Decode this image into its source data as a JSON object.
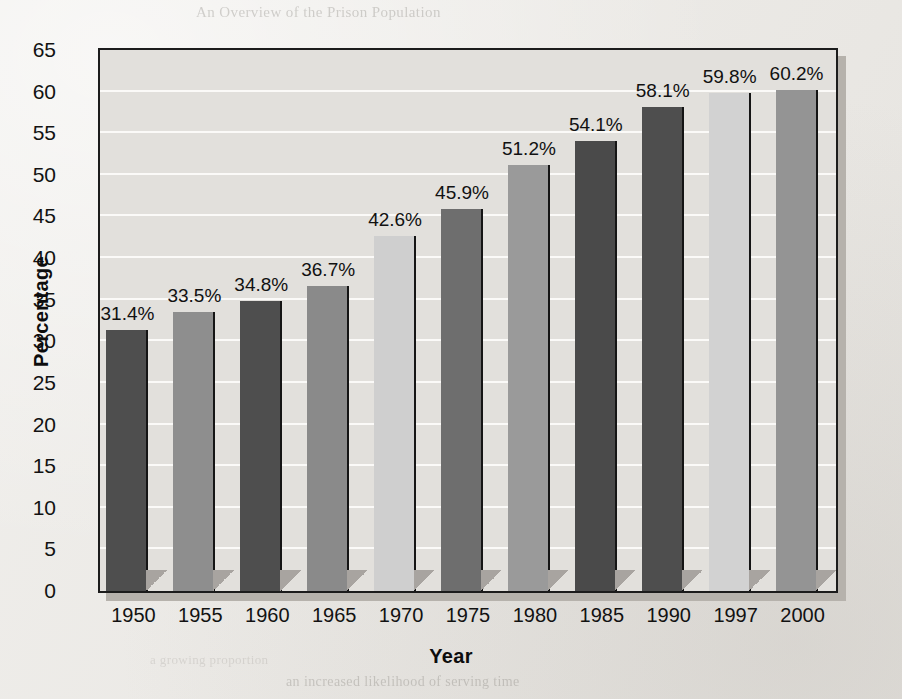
{
  "chart_data": {
    "type": "bar",
    "title": "",
    "xlabel": "Year",
    "ylabel": "Percentage",
    "categories": [
      "1950",
      "1955",
      "1960",
      "1965",
      "1970",
      "1975",
      "1980",
      "1985",
      "1990",
      "1997",
      "2000"
    ],
    "values": [
      31.4,
      33.5,
      34.8,
      36.7,
      42.6,
      45.9,
      51.2,
      54.1,
      58.1,
      59.8,
      60.2
    ],
    "data_labels": [
      "31.4%",
      "33.5%",
      "34.8%",
      "36.7%",
      "42.6%",
      "45.9%",
      "51.2%",
      "54.1%",
      "58.1%",
      "59.8%",
      "60.2%"
    ],
    "ylim": [
      0,
      65
    ],
    "ytick_values": [
      0,
      5,
      10,
      15,
      20,
      25,
      30,
      35,
      40,
      45,
      50,
      55,
      60,
      65
    ],
    "ytick_labels": [
      "0",
      "5",
      "10",
      "15",
      "20",
      "25",
      "30",
      "35",
      "40",
      "45",
      "50",
      "55",
      "60",
      "65"
    ],
    "grid": true,
    "grid_orientation": "horizontal",
    "legend": "none",
    "bar_colors": [
      "#4e4e4e",
      "#8e8e8e",
      "#4e4e4e",
      "#8a8a8a",
      "#cfcfcf",
      "#6e6e6e",
      "#9a9a9a",
      "#4a4a4a",
      "#4e4e4e",
      "#d2d2d2",
      "#949494"
    ]
  },
  "axes": {
    "ylabel": "Percentage",
    "xlabel": "Year"
  },
  "colors": {
    "page_background": "#eceae6",
    "plot_background": "#e2e0dc",
    "gridline": "#fbfaf8",
    "frame": "#1c1c1c",
    "shadow": "#b6b2ac",
    "bar_shadow": "#a8a4a0",
    "text": "#121212"
  },
  "bleed_text": {
    "top": "An Overview of the Prison Population",
    "bottom_right": "an increased likelihood of serving time",
    "bottom_left": "a growing proportion"
  }
}
